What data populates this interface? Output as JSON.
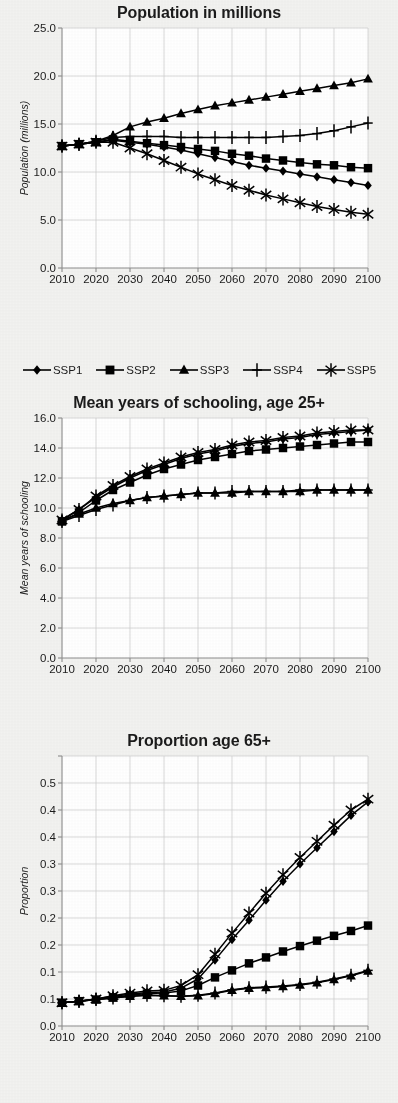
{
  "figure": {
    "background_color": "#f2f2f0",
    "plot_background_color": "#ffffff",
    "grid_color": "#cfcfcf",
    "axis_color": "#8c8c8c",
    "series_color": "#000000"
  },
  "legend": {
    "position": "below-chart-1",
    "items": [
      {
        "label": "SSP1",
        "marker": "diamond"
      },
      {
        "label": "SSP2",
        "marker": "square"
      },
      {
        "label": "SSP3",
        "marker": "triangle"
      },
      {
        "label": "SSP4",
        "marker": "plus"
      },
      {
        "label": "SSP5",
        "marker": "asterisk"
      }
    ]
  },
  "chart_data": [
    {
      "id": "population",
      "type": "line",
      "title": "Population in millions",
      "xlabel": "",
      "ylabel": "Population (millions)",
      "xlim": [
        2010,
        2100
      ],
      "ylim": [
        0.0,
        25.0
      ],
      "ytick_step": 5.0,
      "xtick_step": 10,
      "grid": true,
      "ytick_labels": [
        "0.0",
        "5.0",
        "10.0",
        "15.0",
        "20.0",
        "25.0"
      ],
      "xtick_labels": [
        "2010",
        "2020",
        "2030",
        "2040",
        "2050",
        "2060",
        "2070",
        "2080",
        "2090",
        "2100"
      ],
      "x": [
        2010,
        2015,
        2020,
        2025,
        2030,
        2035,
        2040,
        2045,
        2050,
        2055,
        2060,
        2065,
        2070,
        2075,
        2080,
        2085,
        2090,
        2095,
        2100
      ],
      "series": [
        {
          "name": "SSP1",
          "marker": "diamond",
          "values": [
            12.7,
            12.9,
            13.1,
            13.3,
            13.1,
            12.9,
            12.6,
            12.3,
            11.9,
            11.5,
            11.1,
            10.7,
            10.4,
            10.1,
            9.8,
            9.5,
            9.2,
            8.9,
            8.6
          ]
        },
        {
          "name": "SSP2",
          "marker": "square",
          "values": [
            12.7,
            12.9,
            13.1,
            13.4,
            13.2,
            13.0,
            12.8,
            12.6,
            12.4,
            12.2,
            11.9,
            11.7,
            11.4,
            11.2,
            11.0,
            10.8,
            10.7,
            10.5,
            10.4
          ]
        },
        {
          "name": "SSP3",
          "marker": "triangle",
          "values": [
            12.7,
            12.9,
            13.2,
            13.8,
            14.7,
            15.2,
            15.6,
            16.1,
            16.5,
            16.9,
            17.2,
            17.5,
            17.8,
            18.1,
            18.4,
            18.7,
            19.0,
            19.3,
            19.7
          ]
        },
        {
          "name": "SSP4",
          "marker": "plus",
          "values": [
            12.7,
            12.9,
            13.2,
            13.6,
            13.7,
            13.7,
            13.7,
            13.6,
            13.6,
            13.6,
            13.6,
            13.6,
            13.6,
            13.7,
            13.8,
            14.0,
            14.3,
            14.7,
            15.1
          ]
        },
        {
          "name": "SSP5",
          "marker": "asterisk",
          "values": [
            12.7,
            12.9,
            13.1,
            13.1,
            12.5,
            11.9,
            11.2,
            10.5,
            9.8,
            9.2,
            8.6,
            8.1,
            7.6,
            7.2,
            6.8,
            6.4,
            6.1,
            5.8,
            5.6
          ]
        }
      ]
    },
    {
      "id": "schooling",
      "type": "line",
      "title": "Mean years of schooling, age 25+",
      "xlabel": "",
      "ylabel": "Mean years of schooling",
      "xlim": [
        2010,
        2100
      ],
      "ylim": [
        0.0,
        16.0
      ],
      "ytick_step": 2.0,
      "xtick_step": 10,
      "grid": true,
      "ytick_labels": [
        "0.0",
        "2.0",
        "4.0",
        "6.0",
        "8.0",
        "10.0",
        "12.0",
        "14.0",
        "16.0"
      ],
      "xtick_labels": [
        "2010",
        "2020",
        "2030",
        "2040",
        "2050",
        "2060",
        "2070",
        "2080",
        "2090",
        "2100"
      ],
      "x": [
        2010,
        2015,
        2020,
        2025,
        2030,
        2035,
        2040,
        2045,
        2050,
        2055,
        2060,
        2065,
        2070,
        2075,
        2080,
        2085,
        2090,
        2095,
        2100
      ],
      "series": [
        {
          "name": "SSP1",
          "marker": "diamond",
          "values": [
            9.2,
            9.9,
            10.7,
            11.4,
            12.0,
            12.5,
            12.9,
            13.3,
            13.6,
            13.8,
            14.1,
            14.3,
            14.4,
            14.6,
            14.7,
            14.9,
            15.0,
            15.1,
            15.2
          ]
        },
        {
          "name": "SSP2",
          "marker": "square",
          "values": [
            9.1,
            9.7,
            10.5,
            11.2,
            11.7,
            12.2,
            12.6,
            12.9,
            13.2,
            13.4,
            13.6,
            13.8,
            13.9,
            14.0,
            14.1,
            14.2,
            14.3,
            14.4,
            14.4
          ]
        },
        {
          "name": "SSP3",
          "marker": "triangle",
          "values": [
            9.2,
            9.6,
            10.0,
            10.3,
            10.5,
            10.7,
            10.8,
            10.9,
            11.0,
            11.0,
            11.0,
            11.1,
            11.1,
            11.1,
            11.1,
            11.2,
            11.2,
            11.2,
            11.2
          ]
        },
        {
          "name": "SSP4",
          "marker": "plus",
          "values": [
            9.1,
            9.5,
            9.9,
            10.2,
            10.5,
            10.7,
            10.8,
            10.9,
            11.0,
            11.0,
            11.1,
            11.1,
            11.1,
            11.1,
            11.2,
            11.2,
            11.2,
            11.2,
            11.2
          ]
        },
        {
          "name": "SSP5",
          "marker": "asterisk",
          "values": [
            9.2,
            9.9,
            10.8,
            11.5,
            12.1,
            12.6,
            13.0,
            13.4,
            13.7,
            13.9,
            14.2,
            14.4,
            14.5,
            14.7,
            14.8,
            15.0,
            15.1,
            15.2,
            15.2
          ]
        }
      ]
    },
    {
      "id": "proportion65",
      "type": "line",
      "title": "Proportion age 65+",
      "xlabel": "",
      "ylabel": "Proportion",
      "xlim": [
        2010,
        2100
      ],
      "ylim": [
        0.0,
        0.5
      ],
      "ytick_step": 0.05,
      "xtick_step": 10,
      "grid": true,
      "ytick_labels": [
        "0.0",
        "0.1",
        "0.1",
        "0.2",
        "0.2",
        "0.3",
        "0.3",
        "0.4",
        "0.4",
        "0.5"
      ],
      "ytick_values": [
        0.0,
        0.05,
        0.1,
        0.15,
        0.2,
        0.25,
        0.3,
        0.35,
        0.4,
        0.45,
        0.5
      ],
      "xtick_labels": [
        "2010",
        "2020",
        "2030",
        "2040",
        "2050",
        "2060",
        "2070",
        "2080",
        "2090",
        "2100"
      ],
      "x": [
        2010,
        2015,
        2020,
        2025,
        2030,
        2035,
        2040,
        2045,
        2050,
        2055,
        2060,
        2065,
        2070,
        2075,
        2080,
        2085,
        2090,
        2095,
        2100
      ],
      "series": [
        {
          "name": "SSP1",
          "marker": "diamond",
          "values": [
            0.043,
            0.046,
            0.05,
            0.055,
            0.059,
            0.062,
            0.063,
            0.07,
            0.087,
            0.122,
            0.16,
            0.196,
            0.233,
            0.268,
            0.3,
            0.33,
            0.36,
            0.39,
            0.415
          ]
        },
        {
          "name": "SSP2",
          "marker": "square",
          "values": [
            0.043,
            0.046,
            0.049,
            0.053,
            0.057,
            0.06,
            0.061,
            0.065,
            0.075,
            0.09,
            0.103,
            0.116,
            0.127,
            0.138,
            0.148,
            0.158,
            0.167,
            0.176,
            0.186
          ]
        },
        {
          "name": "SSP3",
          "marker": "triangle",
          "values": [
            0.043,
            0.046,
            0.049,
            0.052,
            0.055,
            0.057,
            0.056,
            0.055,
            0.056,
            0.06,
            0.066,
            0.07,
            0.071,
            0.073,
            0.076,
            0.08,
            0.086,
            0.093,
            0.102
          ]
        },
        {
          "name": "SSP4",
          "marker": "plus",
          "values": [
            0.043,
            0.046,
            0.049,
            0.052,
            0.055,
            0.057,
            0.056,
            0.055,
            0.057,
            0.061,
            0.067,
            0.071,
            0.072,
            0.074,
            0.077,
            0.081,
            0.087,
            0.094,
            0.103
          ]
        },
        {
          "name": "SSP5",
          "marker": "asterisk",
          "values": [
            0.043,
            0.046,
            0.05,
            0.056,
            0.061,
            0.065,
            0.066,
            0.075,
            0.095,
            0.133,
            0.172,
            0.209,
            0.246,
            0.28,
            0.312,
            0.342,
            0.372,
            0.4,
            0.42
          ]
        }
      ]
    }
  ]
}
